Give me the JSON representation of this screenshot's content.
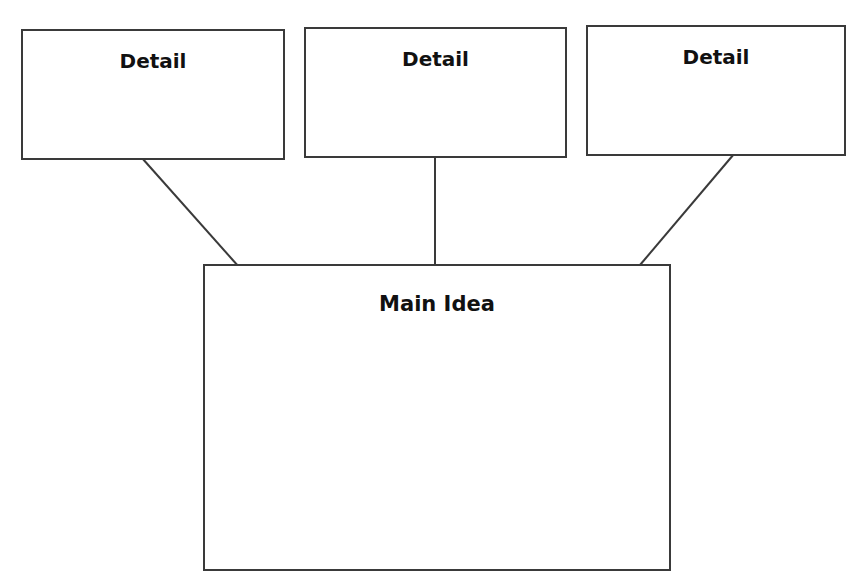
{
  "diagram": {
    "type": "main-idea-and-details graphic organizer",
    "details": [
      {
        "label": "Detail"
      },
      {
        "label": "Detail"
      },
      {
        "label": "Detail"
      }
    ],
    "main": {
      "label": "Main Idea"
    },
    "colors": {
      "stroke": "#3a3a3a",
      "text": "#111111",
      "background": "#ffffff"
    }
  }
}
